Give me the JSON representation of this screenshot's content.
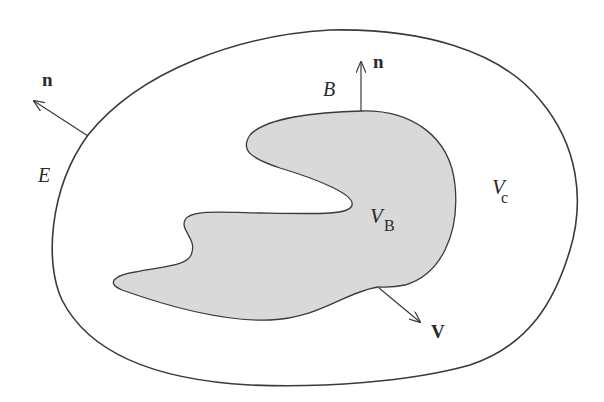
{
  "diagram": {
    "type": "control-volume-schematic",
    "colors": {
      "stroke": "#3a3a3a",
      "body_fill": "#d9d9d9",
      "background": "#ffffff",
      "text": "#2a2a2a"
    },
    "labels": {
      "outer_surface": "E",
      "body_surface": "B",
      "body_volume_main": "V",
      "body_volume_sub": "B",
      "control_volume_main": "V",
      "control_volume_sub": "c",
      "outer_normal": "n",
      "body_normal": "n",
      "velocity": "V"
    }
  }
}
